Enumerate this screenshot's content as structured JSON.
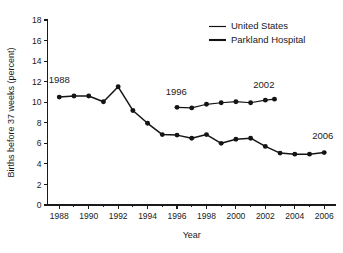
{
  "chart_data": {
    "type": "line",
    "title": "",
    "xlabel": "Year",
    "ylabel": "Births before 37 weeks (percent)",
    "xlim": [
      1987.2,
      2006.8
    ],
    "ylim": [
      0,
      18
    ],
    "yticks": [
      0,
      2,
      4,
      6,
      8,
      10,
      12,
      14,
      16,
      18
    ],
    "xticks_major": [
      1988,
      1990,
      1992,
      1994,
      1996,
      1998,
      2000,
      2002,
      2004,
      2006
    ],
    "xticks_minor": [
      1989,
      1991,
      1993,
      1995,
      1997,
      1999,
      2001,
      2003,
      2005
    ],
    "grid": false,
    "legend_position": "top-right",
    "series": [
      {
        "name": "United States",
        "x": [
          1996,
          1997,
          1998,
          1999,
          2000,
          2001,
          2002
        ],
        "values": [
          9.5,
          9.45,
          9.8,
          9.95,
          10.05,
          9.95,
          10.2
        ],
        "marker": "circle",
        "color": "#141414"
      },
      {
        "name": "Parkland Hospital",
        "x": [
          1988,
          1989,
          1990,
          1991,
          1992,
          1993,
          1994,
          1995,
          1996,
          1997,
          1998,
          1999,
          2000,
          2001,
          2002,
          2003,
          2004,
          2005,
          2006
        ],
        "values": [
          10.5,
          10.6,
          10.6,
          10.05,
          11.5,
          9.2,
          7.95,
          6.85,
          6.8,
          6.5,
          6.85,
          6.0,
          6.4,
          6.5,
          5.7,
          5.05,
          4.95,
          4.95,
          5.1
        ],
        "marker": "circle",
        "color": "#141414"
      }
    ],
    "extra_us_endpoint": {
      "x": 2002,
      "value": 10.3
    },
    "annotations": [
      {
        "text": "1988",
        "x": 1988.0,
        "y": 11.9,
        "name": "annotation-1988"
      },
      {
        "text": "1996",
        "x": 1995.95,
        "y": 10.75,
        "name": "annotation-1996"
      },
      {
        "text": "2002",
        "x": 2001.9,
        "y": 11.4,
        "name": "annotation-2002"
      },
      {
        "text": "2006",
        "x": 2005.9,
        "y": 6.45,
        "name": "annotation-2006"
      }
    ],
    "legend": [
      {
        "label": "United States",
        "style": "thin"
      },
      {
        "label": "Parkland Hospital",
        "style": "thick"
      }
    ],
    "colors": {
      "ink": "#141414",
      "background": "#ffffff"
    }
  }
}
